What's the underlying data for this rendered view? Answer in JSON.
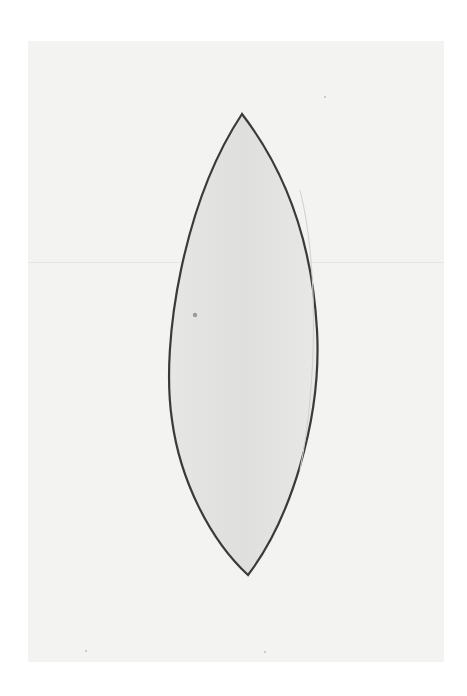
{
  "image": {
    "subject": "Pencil drawing of a pointed lens (vesica) shape on paper",
    "colors": {
      "background": "#ffffff",
      "paper": "#f3f3f2",
      "fill": "#e4e4e2",
      "outline": "#3a3a3a"
    },
    "shape": {
      "top_tip": [
        242,
        114
      ],
      "bottom_tip": [
        248,
        575
      ],
      "left_extent": 170,
      "right_extent": 317
    }
  }
}
